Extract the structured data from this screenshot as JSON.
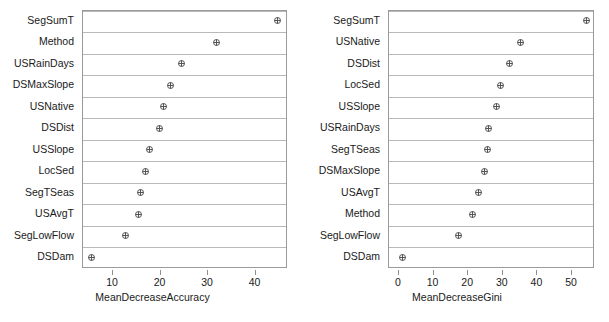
{
  "figure": {
    "type": "variable-importance-dotplot",
    "panel_count": 2,
    "marker": "circle-plus-icon",
    "marker_color": "#555555",
    "grid_color": "#b9b9b9",
    "box_color": "#9a9a9a"
  },
  "chart_data": [
    {
      "type": "scatter",
      "title": "",
      "xlabel": "MeanDecreaseAccuracy",
      "ylabel": "",
      "grid": true,
      "legend": false,
      "xlim": [
        4,
        46.5
      ],
      "xticks": [
        10,
        20,
        30,
        40
      ],
      "xticklabels": [
        "10",
        "20",
        "30",
        "40"
      ],
      "categories": [
        "SegSumT",
        "Method",
        "USRainDays",
        "DSMaxSlope",
        "USNative",
        "DSDist",
        "USSlope",
        "LocSed",
        "SegTSeas",
        "USAvgT",
        "SegLowFlow",
        "DSDam"
      ],
      "values": [
        44.9,
        32.0,
        24.6,
        22.3,
        20.8,
        20.0,
        17.8,
        17.0,
        15.9,
        15.5,
        12.8,
        5.6
      ]
    },
    {
      "type": "scatter",
      "title": "",
      "xlabel": "MeanDecreaseGini",
      "ylabel": "",
      "grid": true,
      "legend": false,
      "xlim": [
        -1.5,
        56.5
      ],
      "xticks": [
        0,
        10,
        20,
        30,
        40,
        50
      ],
      "xticklabels": [
        "0",
        "10",
        "20",
        "30",
        "40",
        "50"
      ],
      "categories": [
        "SegSumT",
        "USNative",
        "DSDist",
        "LocSed",
        "USSlope",
        "USRainDays",
        "SegTSeas",
        "DSMaxSlope",
        "USAvgT",
        "Method",
        "SegLowFlow",
        "DSDam"
      ],
      "values": [
        54.6,
        35.5,
        32.1,
        29.5,
        28.6,
        26.3,
        26.0,
        24.9,
        23.4,
        21.4,
        17.6,
        1.2
      ]
    }
  ]
}
